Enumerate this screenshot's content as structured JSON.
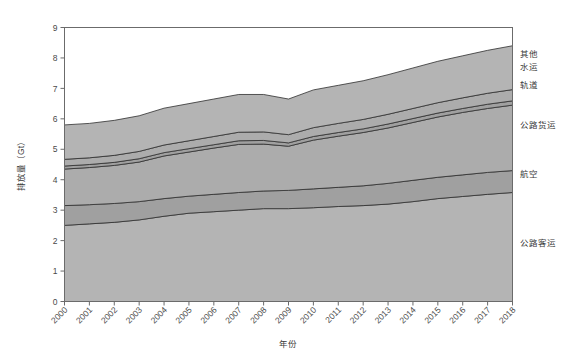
{
  "chart_data": {
    "type": "area",
    "title": "",
    "xlabel": "年份",
    "ylabel": "排放量（Gt）",
    "xlim": [
      2000,
      2018
    ],
    "ylim": [
      0,
      9
    ],
    "yticks": [
      0,
      1,
      2,
      3,
      4,
      5,
      6,
      7,
      8,
      9
    ],
    "grid": false,
    "legend_position": "right-outside",
    "stacked": true,
    "categories": [
      2000,
      2001,
      2002,
      2003,
      2004,
      2005,
      2006,
      2007,
      2008,
      2009,
      2010,
      2011,
      2012,
      2013,
      2014,
      2015,
      2016,
      2017,
      2018
    ],
    "series": [
      {
        "name": "公路客运",
        "values": [
          2.5,
          2.55,
          2.6,
          2.68,
          2.8,
          2.9,
          2.95,
          3.0,
          3.05,
          3.05,
          3.08,
          3.12,
          3.15,
          3.2,
          3.28,
          3.38,
          3.45,
          3.52,
          3.58
        ]
      },
      {
        "name": "航空",
        "values": [
          0.65,
          0.63,
          0.62,
          0.6,
          0.58,
          0.56,
          0.57,
          0.58,
          0.58,
          0.6,
          0.62,
          0.63,
          0.65,
          0.68,
          0.7,
          0.7,
          0.71,
          0.72,
          0.72
        ]
      },
      {
        "name": "公路货运",
        "values": [
          1.2,
          1.22,
          1.25,
          1.3,
          1.4,
          1.45,
          1.52,
          1.58,
          1.54,
          1.45,
          1.6,
          1.68,
          1.75,
          1.82,
          1.9,
          1.98,
          2.05,
          2.1,
          2.15
        ]
      },
      {
        "name": "轨道",
        "values": [
          0.1,
          0.1,
          0.1,
          0.11,
          0.11,
          0.11,
          0.11,
          0.12,
          0.12,
          0.11,
          0.12,
          0.12,
          0.12,
          0.13,
          0.13,
          0.13,
          0.13,
          0.14,
          0.14
        ]
      },
      {
        "name": "水运",
        "values": [
          0.22,
          0.22,
          0.23,
          0.24,
          0.25,
          0.26,
          0.27,
          0.28,
          0.28,
          0.27,
          0.29,
          0.3,
          0.31,
          0.32,
          0.33,
          0.34,
          0.35,
          0.36,
          0.37
        ]
      },
      {
        "name": "其他",
        "values": [
          1.13,
          1.13,
          1.15,
          1.17,
          1.21,
          1.22,
          1.23,
          1.24,
          1.23,
          1.17,
          1.24,
          1.25,
          1.27,
          1.3,
          1.33,
          1.36,
          1.38,
          1.41,
          1.44
        ]
      }
    ],
    "series_totals_top": [
      5.8,
      5.85,
      5.95,
      6.1,
      6.35,
      6.5,
      6.65,
      6.8,
      6.8,
      6.65,
      6.95,
      7.1,
      7.25,
      7.45,
      7.67,
      7.89,
      8.07,
      8.25,
      8.4
    ]
  },
  "axes": {
    "y_tick_labels": [
      "0",
      "1",
      "2",
      "3",
      "4",
      "5",
      "6",
      "7",
      "8",
      "9"
    ],
    "x_tick_labels": [
      "2000",
      "2001",
      "2002",
      "2003",
      "2004",
      "2005",
      "2006",
      "2007",
      "2008",
      "2009",
      "2010",
      "2011",
      "2012",
      "2013",
      "2014",
      "2015",
      "2016",
      "2017",
      "2018"
    ],
    "y_axis_title": "排放量（Gt）",
    "x_axis_title": "年份"
  },
  "legend": {
    "items": [
      {
        "label": "其他"
      },
      {
        "label": "水运"
      },
      {
        "label": "轨道"
      },
      {
        "label": "公路货运"
      },
      {
        "label": "航空"
      },
      {
        "label": "公路客运"
      }
    ]
  },
  "colors": {
    "band_fill_light": "#b4b4b4",
    "band_fill_mid": "#acacac",
    "band_fill_dark": "#a0a0a0",
    "band_stroke": "#2f2f2f",
    "frame": "#6b6b6b",
    "text": "#3a3a3a",
    "background": "#ffffff"
  }
}
